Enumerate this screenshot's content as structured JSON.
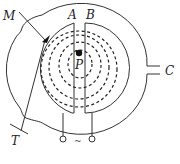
{
  "diagram": {
    "labels": {
      "A": "A",
      "B": "B",
      "C": "C",
      "M": "M",
      "P": "P",
      "T": "T",
      "ac_source": "~"
    },
    "colors": {
      "line": "#333333",
      "background": "#ffffff"
    },
    "dashed_orbit_count": 4
  }
}
